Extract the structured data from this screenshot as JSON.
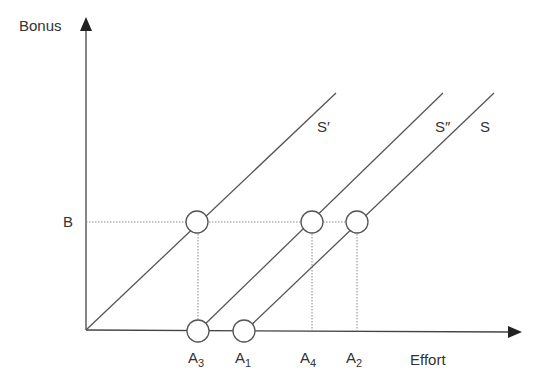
{
  "diagram": {
    "y_axis_label": "Bonus",
    "x_axis_label": "Effort",
    "bonus_level_label": "B",
    "lines": [
      {
        "id": "S_prime",
        "label": "S′"
      },
      {
        "id": "S_double_prime",
        "label": "S″"
      },
      {
        "id": "S",
        "label": "S"
      }
    ],
    "effort_points": [
      {
        "letter": "A",
        "sub": "3"
      },
      {
        "letter": "A",
        "sub": "1"
      },
      {
        "letter": "A",
        "sub": "4"
      },
      {
        "letter": "A",
        "sub": "2"
      }
    ],
    "colors": {
      "line": "#555555",
      "dotted": "#888888",
      "text": "#333333"
    }
  }
}
